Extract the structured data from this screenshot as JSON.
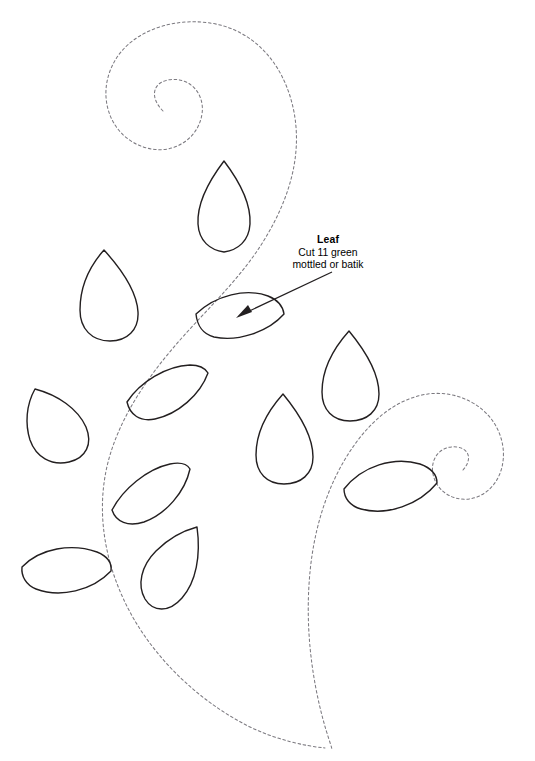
{
  "document": {
    "kind": "applique-pattern-template",
    "title": "Leaf",
    "background_color": "#ffffff",
    "outline_color": "#231f20",
    "stem_color": "#7c7a80",
    "width": 535,
    "height": 761
  },
  "annotation": {
    "title": "Leaf",
    "line1": "Cut 11 green",
    "line2": "mottled or batik",
    "pointer_from": [
      332,
      272
    ],
    "pointer_to": [
      238,
      317
    ]
  },
  "stems": [
    {
      "name": "upper-left-spiral-stem",
      "style": "dashed",
      "description": "Large dashed scroll curling counter-clockwise at upper left, sweeping down through the center and tapering to a point at the bottom."
    },
    {
      "name": "lower-right-spiral-stem",
      "style": "dashed",
      "description": "Dashed scroll curling clockwise at middle right, sweeping down and left to meet the first stem at the bottom point."
    }
  ],
  "leaves": [
    {
      "id": 1,
      "name": "leaf-top-center",
      "shape": "pointed-oval",
      "cx": 224,
      "cy": 206,
      "rx": 26,
      "ry": 46,
      "rotate": -4
    },
    {
      "id": 2,
      "name": "leaf-upper-left",
      "shape": "teardrop",
      "cx": 109,
      "cy": 293,
      "rx": 28,
      "ry": 45,
      "rotate": -18
    },
    {
      "id": 3,
      "name": "leaf-center-labeled",
      "shape": "flat-oval",
      "cx": 239,
      "cy": 316,
      "rx": 45,
      "ry": 23,
      "rotate": 4
    },
    {
      "id": 4,
      "name": "leaf-mid-left-inner",
      "shape": "flat-oval",
      "cx": 164,
      "cy": 392,
      "rx": 44,
      "ry": 25,
      "rotate": -19
    },
    {
      "id": 5,
      "name": "leaf-far-left",
      "shape": "teardrop",
      "cx": 59,
      "cy": 424,
      "rx": 29,
      "ry": 42,
      "rotate": 36
    },
    {
      "id": 6,
      "name": "leaf-right-upper",
      "shape": "teardrop",
      "cx": 352,
      "cy": 375,
      "rx": 27,
      "ry": 45,
      "rotate": 7
    },
    {
      "id": 7,
      "name": "leaf-right-middle",
      "shape": "teardrop",
      "cx": 286,
      "cy": 438,
      "rx": 28,
      "ry": 45,
      "rotate": 3
    },
    {
      "id": 8,
      "name": "leaf-left-lower-inner",
      "shape": "teardrop",
      "cx": 149,
      "cy": 493,
      "rx": 40,
      "ry": 27,
      "rotate": -26
    },
    {
      "id": 9,
      "name": "leaf-right-lower",
      "shape": "flat-oval",
      "cx": 390,
      "cy": 486,
      "rx": 47,
      "ry": 24,
      "rotate": -4
    },
    {
      "id": 10,
      "name": "leaf-lower-center",
      "shape": "teardrop",
      "cx": 175,
      "cy": 570,
      "rx": 28,
      "ry": 44,
      "rotate": 24
    },
    {
      "id": 11,
      "name": "leaf-bottom-left",
      "shape": "flat-oval",
      "cx": 65,
      "cy": 572,
      "rx": 45,
      "ry": 23,
      "rotate": 7
    }
  ]
}
